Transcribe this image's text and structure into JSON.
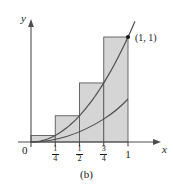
{
  "figure": {
    "caption": "(b)",
    "axes": {
      "y_label": "y",
      "x_label": "x",
      "origin_label": "0"
    },
    "x_ticks": [
      {
        "label": "1/4",
        "numerator": "1",
        "denominator": "4",
        "value": 0.25,
        "is_fraction": true
      },
      {
        "label": "1/2",
        "numerator": "1",
        "denominator": "2",
        "value": 0.5,
        "is_fraction": true
      },
      {
        "label": "3/4",
        "numerator": "3",
        "denominator": "4",
        "value": 0.75,
        "is_fraction": true
      },
      {
        "label": "1",
        "numerator": "",
        "denominator": "",
        "value": 1,
        "is_fraction": false
      }
    ],
    "point_label": "(1, 1)",
    "colors": {
      "bar_fill": "#d5d5d5",
      "bar_stroke": "#5a5a5a",
      "curve": "#4d4d4d",
      "axis": "#4d4d4d",
      "text": "#1a1a1a",
      "background": "#ffffff"
    }
  },
  "chart_data": {
    "type": "bar",
    "title": "(b)",
    "xlabel": "x",
    "ylabel": "y",
    "function": "y = x^2",
    "categories": [
      "[0, 1/4]",
      "[1/4, 1/2]",
      "[1/2, 3/4]",
      "[3/4, 1]"
    ],
    "bar_left_edges": [
      0,
      0.25,
      0.5,
      0.75
    ],
    "bar_right_edges": [
      0.25,
      0.5,
      0.75,
      1
    ],
    "bar_width": 0.25,
    "values": [
      0.0625,
      0.25,
      0.5625,
      1
    ],
    "value_labels": [
      "1/16",
      "1/4",
      "9/16",
      "1"
    ],
    "sample_points": [
      0.25,
      0.5,
      0.75,
      1
    ],
    "sample_rule": "right endpoint",
    "total_area": 0.46875,
    "xlim": [
      0,
      1.1
    ],
    "ylim": [
      0,
      1.15
    ],
    "xticks": [
      0.25,
      0.5,
      0.75,
      1
    ],
    "xticklabels": [
      "1/4",
      "1/2",
      "3/4",
      "1"
    ],
    "yticks": [],
    "yticklabels": [],
    "grid": false,
    "legend": false,
    "annotations": [
      {
        "text": "(1, 1)",
        "x": 1,
        "y": 1,
        "marker": "dot"
      },
      {
        "text": "0",
        "x": 0,
        "y": 0,
        "marker": "none"
      }
    ],
    "curve": {
      "name": "y = x^2",
      "x": [
        0,
        0.1,
        0.2,
        0.3,
        0.4,
        0.5,
        0.6,
        0.7,
        0.8,
        0.9,
        1,
        1.05
      ],
      "y": [
        0,
        0.01,
        0.04,
        0.09,
        0.16,
        0.25,
        0.36,
        0.49,
        0.64,
        0.81,
        1,
        1.1025
      ]
    }
  }
}
